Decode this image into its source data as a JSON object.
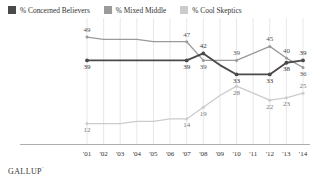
{
  "legend": {
    "items": [
      {
        "label": "% Concerned Believers",
        "color": "#4a4a4a",
        "icon": "square-swatch-icon"
      },
      {
        "label": "% Mixed Middle",
        "color": "#9a9a9a",
        "icon": "square-swatch-icon"
      },
      {
        "label": "% Cool Skeptics",
        "color": "#cccccc",
        "icon": "square-swatch-icon"
      }
    ]
  },
  "footer": {
    "brand": "GALLUP",
    "mark": "’"
  },
  "chart_data": {
    "type": "line",
    "title": "",
    "xlabel": "",
    "ylabel": "",
    "ylim": [
      0,
      55
    ],
    "grid": true,
    "legend_position": "top-left",
    "categories": [
      "'01",
      "'02",
      "'03",
      "'04",
      "'05",
      "'06",
      "'07",
      "'08",
      "'09",
      "'10",
      "'11",
      "'12",
      "'13",
      "'14"
    ],
    "series": [
      {
        "name": "% Concerned Believers",
        "color": "#4a4a4a",
        "values": [
          39,
          39,
          39,
          39,
          39,
          39,
          39,
          42,
          37,
          33,
          33,
          33,
          38,
          39
        ],
        "labels": [
          {
            "category": "'01",
            "value": 39,
            "position": "below"
          },
          {
            "category": "'07",
            "value": 39,
            "position": "below"
          },
          {
            "category": "'08",
            "value": 42,
            "position": "above"
          },
          {
            "category": "'10",
            "value": 33,
            "position": "below"
          },
          {
            "category": "'12",
            "value": 33,
            "position": "below"
          },
          {
            "category": "'13",
            "value": 38,
            "position": "below"
          },
          {
            "category": "'14",
            "value": 39,
            "position": "above"
          }
        ]
      },
      {
        "name": "% Mixed Middle",
        "color": "#9a9a9a",
        "values": [
          49,
          48,
          48,
          48,
          47,
          47,
          47,
          39,
          39,
          39,
          42,
          45,
          40,
          36
        ],
        "labels": [
          {
            "category": "'01",
            "value": 49,
            "position": "above"
          },
          {
            "category": "'07",
            "value": 47,
            "position": "above"
          },
          {
            "category": "'08",
            "value": 39,
            "position": "below"
          },
          {
            "category": "'10",
            "value": 39,
            "position": "above"
          },
          {
            "category": "'12",
            "value": 45,
            "position": "above"
          },
          {
            "category": "'13",
            "value": 40,
            "position": "above"
          },
          {
            "category": "'14",
            "value": 36,
            "position": "below"
          }
        ]
      },
      {
        "name": "% Cool Skeptics",
        "color": "#cccccc",
        "values": [
          12,
          12,
          12,
          13,
          13,
          14,
          14,
          19,
          24,
          28,
          25,
          22,
          23,
          25
        ],
        "labels": [
          {
            "category": "'01",
            "value": 12,
            "position": "below"
          },
          {
            "category": "'07",
            "value": 14,
            "position": "below"
          },
          {
            "category": "'08",
            "value": 19,
            "position": "below"
          },
          {
            "category": "'10",
            "value": 28,
            "position": "below"
          },
          {
            "category": "'12",
            "value": 22,
            "position": "below"
          },
          {
            "category": "'13",
            "value": 23,
            "position": "below"
          },
          {
            "category": "'14",
            "value": 25,
            "position": "above"
          }
        ]
      }
    ],
    "marker_categories": [
      "'01",
      "'07",
      "'08",
      "'10",
      "'12",
      "'13",
      "'14"
    ]
  }
}
